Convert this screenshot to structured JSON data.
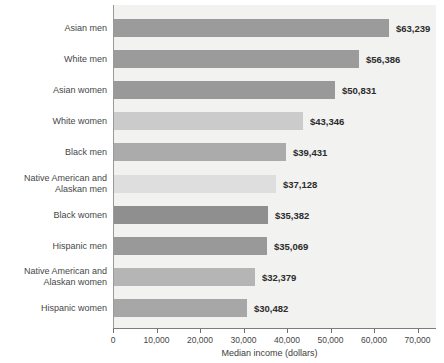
{
  "chart_data": {
    "type": "bar",
    "orientation": "horizontal",
    "xlabel": "Median income (dollars)",
    "xlim": [
      0,
      74000
    ],
    "xticks": [
      0,
      10000,
      20000,
      30000,
      40000,
      50000,
      60000,
      70000
    ],
    "xtick_labels": [
      "0",
      "10,000",
      "20,000",
      "30,000",
      "40,000",
      "50,000",
      "60,000",
      "70,000"
    ],
    "grid": false,
    "legend": false,
    "plot_background": "#f2f2f1",
    "categories": [
      "Asian men",
      "White men",
      "Asian women",
      "White women",
      "Black men",
      "Native American and Alaskan men",
      "Black women",
      "Hispanic men",
      "Native American and Alaskan women",
      "Hispanic women"
    ],
    "category_label_lines": [
      [
        "Asian men"
      ],
      [
        "White men"
      ],
      [
        "Asian women"
      ],
      [
        "White women"
      ],
      [
        "Black men"
      ],
      [
        "Native American and",
        "Alaskan men"
      ],
      [
        "Black women"
      ],
      [
        "Hispanic men"
      ],
      [
        "Native American and",
        "Alaskan women"
      ],
      [
        "Hispanic women"
      ]
    ],
    "values": [
      63239,
      56386,
      50831,
      43346,
      39431,
      37128,
      35382,
      35069,
      32379,
      30482
    ],
    "value_labels": [
      "$63,239",
      "$56,386",
      "$50,831",
      "$43,346",
      "$39,431",
      "$37,128",
      "$35,382",
      "$35,069",
      "$32,379",
      "$30,482"
    ],
    "bar_colors": [
      "#9b9b9b",
      "#9b9b9b",
      "#999999",
      "#cbcbcb",
      "#ababab",
      "#dedede",
      "#8f8f8f",
      "#999999",
      "#b5b5b5",
      "#a7a7a7"
    ],
    "axis_line_color": "#7d7d7d",
    "tick_color": "#6d6d6d",
    "category_label_color": "#474747",
    "value_label_color": "#2c2c2c"
  }
}
